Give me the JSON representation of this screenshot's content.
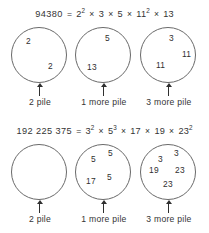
{
  "figure": {
    "background_color": "#ffffff",
    "ink_color": "#2f2f2f",
    "circle_stroke_color": "#6a6a6a"
  },
  "rows": [
    {
      "equation": {
        "result": "94380",
        "equals": "=",
        "terms": [
          {
            "base": "2",
            "exp": "2"
          },
          {
            "base": "3",
            "exp": ""
          },
          {
            "base": "5",
            "exp": ""
          },
          {
            "base": "11",
            "exp": "2"
          },
          {
            "base": "13",
            "exp": ""
          }
        ],
        "operator": "×",
        "full_text": "94380 = 2² × 3 × 5 × 11² × 13"
      },
      "piles": [
        {
          "label": "2 pile",
          "factors": [
            {
              "value": "2",
              "x": 14,
              "y": 9
            },
            {
              "value": "2",
              "x": 36,
              "y": 34
            }
          ]
        },
        {
          "label": "1 more pile",
          "factors": [
            {
              "value": "5",
              "x": 29,
              "y": 6
            },
            {
              "value": "13",
              "x": 11,
              "y": 35
            }
          ]
        },
        {
          "label": "3 more pile",
          "factors": [
            {
              "value": "3",
              "x": 28,
              "y": 6
            },
            {
              "value": "11",
              "x": 41,
              "y": 22
            },
            {
              "value": "11",
              "x": 15,
              "y": 33
            }
          ]
        }
      ]
    },
    {
      "equation": {
        "result": "192 225 375",
        "equals": "=",
        "terms": [
          {
            "base": "3",
            "exp": "2"
          },
          {
            "base": "5",
            "exp": "3"
          },
          {
            "base": "17",
            "exp": ""
          },
          {
            "base": "19",
            "exp": ""
          },
          {
            "base": "23",
            "exp": "2"
          }
        ],
        "operator": "×",
        "full_text": "192 225 375 = 3² × 5³ × 17 × 19 × 23²"
      },
      "piles": [
        {
          "label": "2 pile",
          "factors": []
        },
        {
          "label": "1 more pile",
          "factors": [
            {
              "value": "5",
              "x": 15,
              "y": 10
            },
            {
              "value": "5",
              "x": 32,
              "y": 4
            },
            {
              "value": "17",
              "x": 10,
              "y": 32
            },
            {
              "value": "5",
              "x": 31,
              "y": 28
            }
          ]
        },
        {
          "label": "3 more pile",
          "factors": [
            {
              "value": "3",
              "x": 17,
              "y": 10
            },
            {
              "value": "3",
              "x": 33,
              "y": 4
            },
            {
              "value": "19",
              "x": 8,
              "y": 21
            },
            {
              "value": "23",
              "x": 34,
              "y": 21
            },
            {
              "value": "23",
              "x": 22,
              "y": 35
            }
          ]
        }
      ]
    }
  ]
}
